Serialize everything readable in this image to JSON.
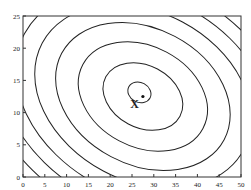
{
  "chart_data": {
    "type": "contour",
    "title": "",
    "xlabel": "",
    "ylabel": "",
    "xlim": [
      0,
      50
    ],
    "ylim": [
      0,
      25
    ],
    "x_ticks": [
      "0",
      "5",
      "10",
      "15",
      "20",
      "25",
      "30",
      "35",
      "40",
      "45",
      "50"
    ],
    "y_ticks": [
      "0",
      "5",
      "10",
      "15",
      "20",
      "25"
    ],
    "grid": false,
    "legend": null,
    "minimum_point": {
      "x": 27.5,
      "y": 12.5,
      "label": "X"
    },
    "contours": {
      "center": [
        27.5,
        12.5
      ],
      "shape": "concentric tilted ellipses (axis tilted down-right)",
      "count_visible": 12
    },
    "annotations": [
      {
        "text": "X",
        "x": 25.5,
        "y": 11.5
      }
    ]
  },
  "colors": {
    "line": "#222222",
    "background": "#ffffff"
  }
}
